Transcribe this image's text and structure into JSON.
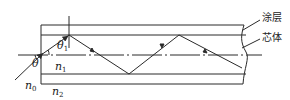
{
  "figure": {
    "labels": {
      "theta1": {
        "symbol": "θ",
        "sub": "1"
      },
      "theta": {
        "symbol": "θ",
        "sub": ""
      },
      "n1": {
        "symbol": "n",
        "sub": "1"
      },
      "n0": {
        "symbol": "n",
        "sub": "0"
      },
      "n2": {
        "symbol": "n",
        "sub": "2"
      },
      "coating": "涂层",
      "core": "芯体"
    },
    "colors": {
      "line": "#2a2a2a",
      "background": "#ffffff"
    }
  }
}
